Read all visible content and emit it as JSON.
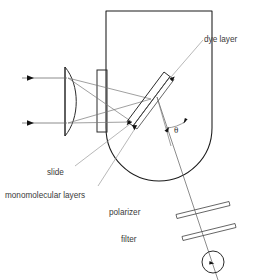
{
  "diagram": {
    "labels": {
      "dye_layer": "dye layer",
      "slide": "slide",
      "monomolecular_layers": "monomolecular layers",
      "polarizer": "polarizer",
      "filter": "filter",
      "theta": "θ"
    },
    "components": [
      {
        "name": "incident-beam-upper",
        "type": "ray",
        "description": "upper incoming light ray with arrowhead"
      },
      {
        "name": "incident-beam-lower",
        "type": "ray",
        "description": "lower incoming light ray with arrowhead"
      },
      {
        "name": "lens",
        "type": "plano-convex-lens",
        "description": "focusing lens, flat left face, convex right face"
      },
      {
        "name": "window",
        "type": "rectangular-window",
        "description": "entrance window of the vessel"
      },
      {
        "name": "vessel",
        "type": "cell",
        "description": "U-shaped sample cell with rounded bottom"
      },
      {
        "name": "slide",
        "type": "tilted-slide",
        "description": "tilted glass slide inside the cell"
      },
      {
        "name": "dye-layer",
        "type": "thin-film",
        "description": "dye layer on the slide surface"
      },
      {
        "name": "monomolecular-layers",
        "type": "thin-film",
        "description": "monomolecular layers on the slide"
      },
      {
        "name": "polarizer",
        "type": "plate",
        "description": "slanted polarizer plate in the emission path"
      },
      {
        "name": "filter",
        "type": "plate",
        "description": "slanted filter plate in the emission path"
      },
      {
        "name": "detector",
        "type": "circle",
        "description": "circular detector at the bottom"
      },
      {
        "name": "angle-theta",
        "type": "angle-marker",
        "description": "angle theta between the normal and the emission direction"
      }
    ],
    "colors": {
      "stroke_main": "#1a1a1a",
      "stroke_optic": "#2b2b2b",
      "stroke_ray": "#777777",
      "stroke_leader": "#9a9a9a",
      "text": "#3a3a3a",
      "background": "#ffffff"
    }
  }
}
